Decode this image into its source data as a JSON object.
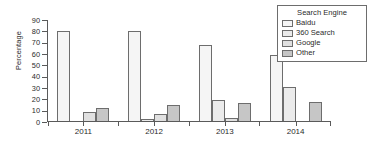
{
  "chart_data": {
    "type": "bar",
    "title": "",
    "xlabel": "",
    "ylabel": "Percentage",
    "categories": [
      "2011",
      "2012",
      "2013",
      "2014"
    ],
    "ylim": [
      0,
      90
    ],
    "yticks": [
      0,
      10,
      20,
      30,
      40,
      50,
      60,
      70,
      80,
      90
    ],
    "grid": false,
    "legend_title": "Search Engine",
    "legend_position": "top-right",
    "series": [
      {
        "name": "Baidu",
        "color": "#f5f5f5",
        "values": [
          80,
          80.5,
          68,
          59
        ]
      },
      {
        "name": "360 Search",
        "color": "#ebebeb",
        "values": [
          0,
          2,
          19,
          30
        ]
      },
      {
        "name": "Google",
        "color": "#e0e0e0",
        "values": [
          8,
          6,
          3,
          0
        ]
      },
      {
        "name": "Other",
        "color": "#c6c6c6",
        "values": [
          12,
          14,
          16,
          16.5
        ]
      }
    ]
  }
}
